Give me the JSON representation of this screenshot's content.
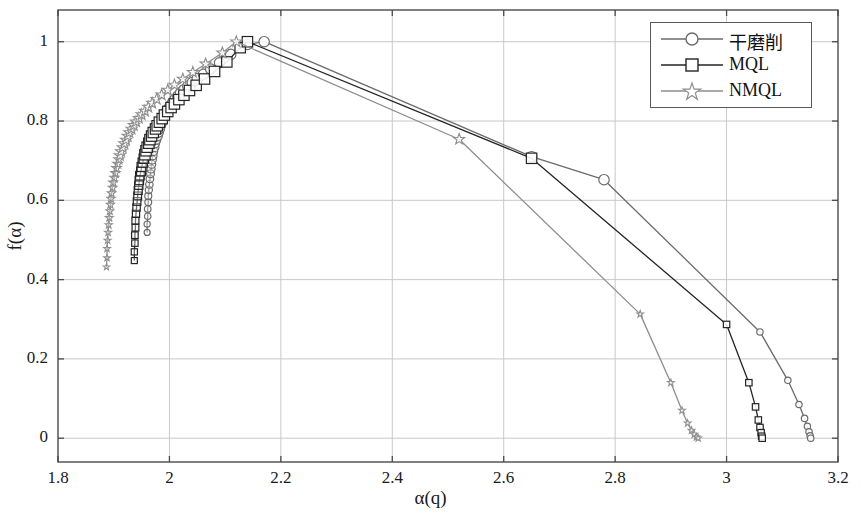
{
  "chart_data": {
    "type": "line",
    "title": "",
    "subtitle": "",
    "xlabel": "α(q)",
    "ylabel": "f(α)",
    "xlim": [
      1.8,
      3.2
    ],
    "ylim": [
      -0.06,
      1.08
    ],
    "xticks": [
      1.8,
      2,
      2.2,
      2.4,
      2.6,
      2.8,
      3,
      3.2
    ],
    "xticklabels": [
      "1.8",
      "2",
      "2.2",
      "2.4",
      "2.6",
      "2.8",
      "3",
      "3.2"
    ],
    "yticks": [
      0,
      0.2,
      0.4,
      0.6,
      0.8,
      1
    ],
    "yticklabels": [
      "0",
      "0.2",
      "0.4",
      "0.6",
      "0.8",
      "1"
    ],
    "grid": true,
    "legend_position": "top-right",
    "series": [
      {
        "name": "干磨削",
        "marker": "circle",
        "color": "#6b6b6b",
        "points": [
          [
            1.96,
            0.519
          ],
          [
            1.96,
            0.54
          ],
          [
            1.961,
            0.56
          ],
          [
            1.961,
            0.578
          ],
          [
            1.962,
            0.595
          ],
          [
            1.962,
            0.611
          ],
          [
            1.963,
            0.626
          ],
          [
            1.964,
            0.64
          ],
          [
            1.965,
            0.654
          ],
          [
            1.966,
            0.667
          ],
          [
            1.967,
            0.679
          ],
          [
            1.968,
            0.691
          ],
          [
            1.969,
            0.702
          ],
          [
            1.97,
            0.713
          ],
          [
            1.971,
            0.724
          ],
          [
            1.973,
            0.734
          ],
          [
            1.974,
            0.744
          ],
          [
            1.976,
            0.753
          ],
          [
            1.978,
            0.763
          ],
          [
            1.98,
            0.772
          ],
          [
            1.982,
            0.781
          ],
          [
            1.984,
            0.79
          ],
          [
            1.986,
            0.798
          ],
          [
            1.989,
            0.807
          ],
          [
            1.992,
            0.815
          ],
          [
            1.995,
            0.823
          ],
          [
            1.998,
            0.831
          ],
          [
            2.002,
            0.839
          ],
          [
            2.006,
            0.847
          ],
          [
            2.01,
            0.855
          ],
          [
            2.015,
            0.863
          ],
          [
            2.02,
            0.871
          ],
          [
            2.026,
            0.879
          ],
          [
            2.033,
            0.888
          ],
          [
            2.041,
            0.897
          ],
          [
            2.05,
            0.907
          ],
          [
            2.061,
            0.918
          ],
          [
            2.074,
            0.931
          ],
          [
            2.09,
            0.947
          ],
          [
            2.11,
            0.968
          ],
          [
            2.14,
            0.993
          ],
          [
            2.17,
            1.0
          ],
          [
            2.65,
            0.71
          ],
          [
            2.78,
            0.652
          ],
          [
            3.06,
            0.268
          ],
          [
            3.11,
            0.146
          ],
          [
            3.13,
            0.085
          ],
          [
            3.14,
            0.05
          ],
          [
            3.145,
            0.03
          ],
          [
            3.148,
            0.016
          ],
          [
            3.15,
            0.006
          ],
          [
            3.151,
            0.0
          ]
        ]
      },
      {
        "name": "MQL",
        "marker": "square",
        "color": "#242424",
        "points": [
          [
            1.937,
            0.448
          ],
          [
            1.937,
            0.47
          ],
          [
            1.938,
            0.492
          ],
          [
            1.938,
            0.512
          ],
          [
            1.939,
            0.531
          ],
          [
            1.939,
            0.549
          ],
          [
            1.94,
            0.566
          ],
          [
            1.941,
            0.582
          ],
          [
            1.942,
            0.597
          ],
          [
            1.943,
            0.611
          ],
          [
            1.944,
            0.625
          ],
          [
            1.945,
            0.638
          ],
          [
            1.946,
            0.65
          ],
          [
            1.947,
            0.662
          ],
          [
            1.949,
            0.673
          ],
          [
            1.95,
            0.684
          ],
          [
            1.952,
            0.695
          ],
          [
            1.954,
            0.705
          ],
          [
            1.956,
            0.715
          ],
          [
            1.958,
            0.725
          ],
          [
            1.96,
            0.734
          ],
          [
            1.963,
            0.744
          ],
          [
            1.965,
            0.753
          ],
          [
            1.968,
            0.762
          ],
          [
            1.971,
            0.771
          ],
          [
            1.975,
            0.78
          ],
          [
            1.978,
            0.788
          ],
          [
            1.982,
            0.797
          ],
          [
            1.987,
            0.806
          ],
          [
            1.991,
            0.815
          ],
          [
            1.997,
            0.824
          ],
          [
            2.003,
            0.834
          ],
          [
            2.009,
            0.843
          ],
          [
            2.017,
            0.854
          ],
          [
            2.026,
            0.865
          ],
          [
            2.036,
            0.877
          ],
          [
            2.048,
            0.89
          ],
          [
            2.063,
            0.906
          ],
          [
            2.081,
            0.925
          ],
          [
            2.103,
            0.949
          ],
          [
            2.127,
            0.985
          ],
          [
            2.14,
            1.0
          ],
          [
            2.65,
            0.706
          ],
          [
            3.0,
            0.287
          ],
          [
            3.04,
            0.14
          ],
          [
            3.052,
            0.079
          ],
          [
            3.057,
            0.046
          ],
          [
            3.06,
            0.027
          ],
          [
            3.062,
            0.014
          ],
          [
            3.063,
            0.005
          ],
          [
            3.064,
            0.0
          ]
        ]
      },
      {
        "name": "NMQL",
        "marker": "star",
        "color": "#8e8e8e",
        "points": [
          [
            1.887,
            0.432
          ],
          [
            1.888,
            0.455
          ],
          [
            1.888,
            0.478
          ],
          [
            1.889,
            0.499
          ],
          [
            1.89,
            0.519
          ],
          [
            1.891,
            0.538
          ],
          [
            1.892,
            0.556
          ],
          [
            1.893,
            0.573
          ],
          [
            1.894,
            0.589
          ],
          [
            1.895,
            0.604
          ],
          [
            1.896,
            0.618
          ],
          [
            1.898,
            0.632
          ],
          [
            1.899,
            0.645
          ],
          [
            1.901,
            0.657
          ],
          [
            1.903,
            0.669
          ],
          [
            1.905,
            0.681
          ],
          [
            1.907,
            0.692
          ],
          [
            1.909,
            0.703
          ],
          [
            1.911,
            0.713
          ],
          [
            1.913,
            0.723
          ],
          [
            1.916,
            0.733
          ],
          [
            1.919,
            0.743
          ],
          [
            1.922,
            0.752
          ],
          [
            1.925,
            0.762
          ],
          [
            1.928,
            0.771
          ],
          [
            1.932,
            0.78
          ],
          [
            1.936,
            0.789
          ],
          [
            1.94,
            0.798
          ],
          [
            1.945,
            0.807
          ],
          [
            1.95,
            0.816
          ],
          [
            1.956,
            0.825
          ],
          [
            1.962,
            0.835
          ],
          [
            1.969,
            0.845
          ],
          [
            1.977,
            0.855
          ],
          [
            1.986,
            0.866
          ],
          [
            1.997,
            0.878
          ],
          [
            2.009,
            0.891
          ],
          [
            2.024,
            0.906
          ],
          [
            2.042,
            0.923
          ],
          [
            2.065,
            0.944
          ],
          [
            2.095,
            0.972
          ],
          [
            2.12,
            1.0
          ],
          [
            2.52,
            0.754
          ],
          [
            2.845,
            0.313
          ],
          [
            2.9,
            0.14
          ],
          [
            2.92,
            0.07
          ],
          [
            2.93,
            0.038
          ],
          [
            2.937,
            0.02
          ],
          [
            2.942,
            0.01
          ],
          [
            2.946,
            0.003
          ],
          [
            2.949,
            0.0
          ]
        ]
      }
    ]
  },
  "legend": {
    "items": [
      {
        "label": "干磨削",
        "marker": "circle-marker",
        "color": "#6b6b6b"
      },
      {
        "label": "MQL",
        "marker": "square-marker",
        "color": "#242424"
      },
      {
        "label": "NMQL",
        "marker": "star-marker",
        "color": "#8e8e8e"
      }
    ]
  },
  "style": {
    "axis_color": "#4a4a4a",
    "grid_color": "#c8c8c8",
    "background": "#ffffff"
  }
}
